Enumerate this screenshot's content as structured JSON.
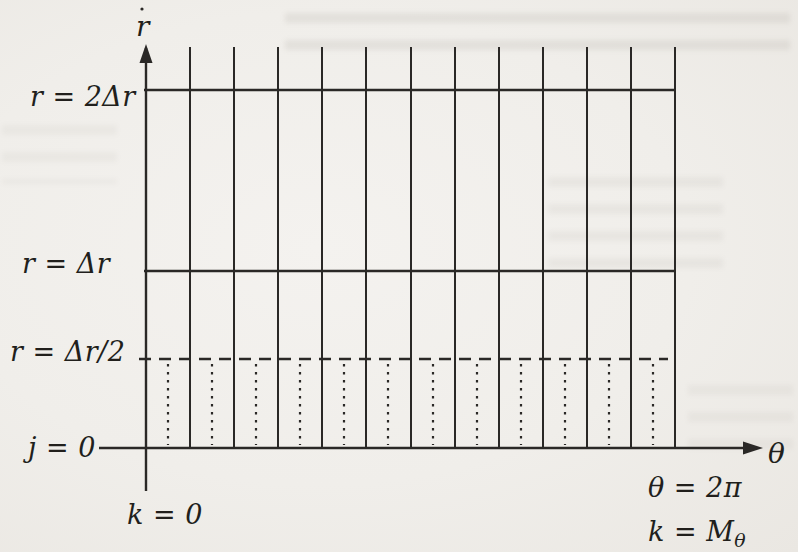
{
  "figure": {
    "axis": {
      "r_label": "r",
      "theta_label": "θ"
    },
    "line_labels": {
      "r_2dr": "r = 2Δr",
      "r_dr": "r = Δr",
      "r_half_dr": "r = Δr/2",
      "j_zero": "j = 0"
    },
    "corner_labels": {
      "k_zero": "k = 0",
      "theta_max": "θ = 2π",
      "k_max_main": "k = M",
      "k_max_sub": "θ"
    }
  },
  "diagram": {
    "colors": {
      "ink": "#2a2826",
      "paper": "#f1efeb"
    },
    "r_axis": {
      "x": 146,
      "y_top": 44,
      "y_bottom": 491
    },
    "theta_axis": {
      "y": 448,
      "x_left": 99,
      "x_right": 748,
      "arrow_tip_x": 763
    },
    "h_lines": [
      {
        "name": "r-2dr-line",
        "y": 90,
        "x1": 144,
        "x2": 676,
        "style": "solid"
      },
      {
        "name": "r-dr-line",
        "y": 271,
        "x1": 144,
        "x2": 676,
        "style": "solid"
      },
      {
        "name": "r-half-dr-line",
        "y": 359,
        "x1": 139,
        "x2": 668,
        "style": "dashed"
      }
    ],
    "v_solid": {
      "xs": [
        190,
        234,
        278,
        322,
        366,
        411,
        455,
        499,
        543,
        587,
        631,
        675
      ],
      "y1": 47,
      "y2": 448
    },
    "v_dotted": {
      "xs": [
        168,
        212,
        256,
        300,
        344,
        388,
        433,
        477,
        521,
        565,
        609,
        653
      ],
      "y1": 364,
      "y2": 445
    },
    "ink_speck": {
      "x": 142,
      "y": 9,
      "r": 1.6
    }
  }
}
